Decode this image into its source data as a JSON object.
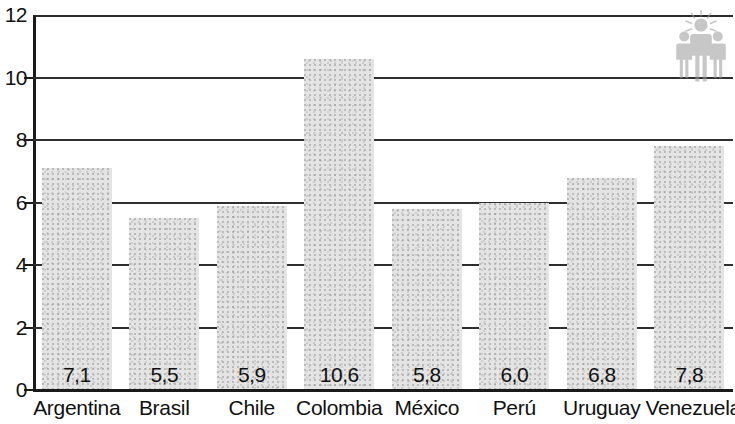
{
  "chart_data": {
    "type": "bar",
    "title": "",
    "subtitle": "",
    "xlabel": "",
    "ylabel": "",
    "ylim": [
      0,
      12
    ],
    "ytick_values": [
      0,
      2,
      4,
      6,
      8,
      10,
      12
    ],
    "ytick_labels": [
      "0",
      "2",
      "4",
      "6",
      "8",
      "10",
      "12"
    ],
    "grid": true,
    "gridlines_at": [
      2,
      4,
      6,
      8,
      10,
      12
    ],
    "legend": null,
    "legend_position": "none",
    "decimal_separator": ",",
    "categories": [
      "Argentina",
      "Brasil",
      "Chile",
      "Colombia",
      "México",
      "Perú",
      "Uruguay",
      "Venezuela"
    ],
    "values": [
      7.1,
      5.5,
      5.9,
      10.6,
      5.8,
      6.0,
      6.8,
      7.8
    ],
    "value_labels": [
      "7,1",
      "5,5",
      "5,9",
      "10,6",
      "5,8",
      "6,0",
      "6,8",
      "7,8"
    ],
    "bar_color": "#e4e4e4",
    "axis_color": "#1a1a1a",
    "gridline_color": "#2e2e2e",
    "label_color": "#111111"
  },
  "watermark": {
    "icon": "people-group-icon",
    "description": "group of three human figures with rays above the central head"
  }
}
